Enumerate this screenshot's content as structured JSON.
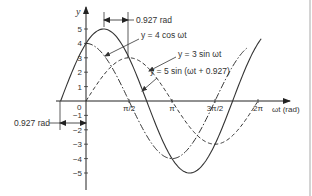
{
  "figure": {
    "y_axis_label": "y",
    "x_axis_label": "ωt (rad)",
    "origin_label": "0",
    "border_color": "#d4d4d4",
    "line_color": "#333333"
  },
  "annotations": {
    "top_dimension_label": "0.927 rad",
    "bottom_dimension_label": "0.927 rad"
  },
  "curve_labels": {
    "cos4": "y = 4 cos ωt",
    "sin3": "y = 3 sin ωt",
    "sin5": "y = 5 sin (ωt + 0.927)"
  },
  "chart_data": {
    "type": "line",
    "title": "",
    "xlabel": "ωt (rad)",
    "ylabel": "y",
    "x_ticks": [
      {
        "label": "π/2",
        "value": 1.5708
      },
      {
        "label": "π",
        "value": 3.1416
      },
      {
        "label": "3π/2",
        "value": 4.7124
      },
      {
        "label": "2π",
        "value": 6.2832
      }
    ],
    "y_ticks": [
      5,
      4,
      3,
      2,
      1,
      -1,
      -2,
      -3,
      -4,
      -5
    ],
    "ylim": [
      -5.5,
      6.4
    ],
    "xlim": [
      -0.927,
      7.3
    ],
    "series": [
      {
        "name": "y = 4 cos ωt",
        "amplitude": 4,
        "phase": 1.5708,
        "style": "dash-dot",
        "x_start": 0,
        "x_end": 5.9
      },
      {
        "name": "y = 3 sin ωt",
        "amplitude": 3,
        "phase": 0,
        "style": "dashed",
        "x_start": 0,
        "x_end": 6.2832
      },
      {
        "name": "y = 5 sin (ωt + 0.927)",
        "amplitude": 5,
        "phase": 0.927,
        "style": "solid",
        "x_start": -0.927,
        "x_end": 6.4
      }
    ],
    "annotations": [
      {
        "text": "0.927 rad",
        "between": [
          0.644,
          1.5708
        ],
        "note": "phase lead between 5sin peak and 3sin peak"
      },
      {
        "text": "0.927 rad",
        "between": [
          -0.927,
          0
        ],
        "note": "phase lead at zero crossing"
      }
    ],
    "grid": false
  }
}
